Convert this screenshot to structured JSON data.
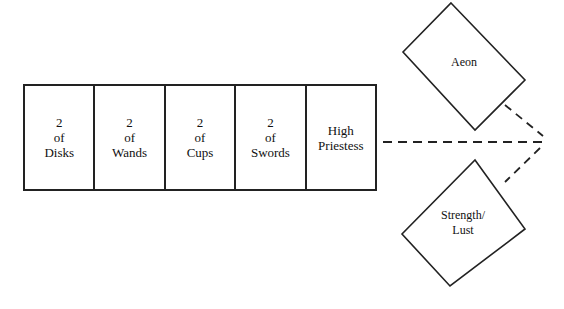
{
  "diagram": {
    "row_cards": [
      {
        "line1": "2",
        "line2": "of",
        "line3": "Disks"
      },
      {
        "line1": "2",
        "line2": "of",
        "line3": "Wands"
      },
      {
        "line1": "2",
        "line2": "of",
        "line3": "Cups"
      },
      {
        "line1": "2",
        "line2": "of",
        "line3": "Swords"
      },
      {
        "line1": "High",
        "line2": "Priestess",
        "line3": ""
      }
    ],
    "diamonds": [
      {
        "label": "Aeon"
      },
      {
        "label_line1": "Strength/",
        "label_line2": "Lust"
      }
    ],
    "connector": "dashed"
  }
}
